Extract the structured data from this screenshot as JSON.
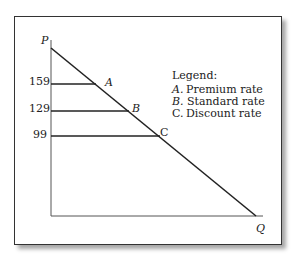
{
  "axes": {
    "y_label": "P",
    "x_label": "Q"
  },
  "price_ticks": [
    {
      "value": "159",
      "point": "A"
    },
    {
      "value": "129",
      "point": "B"
    },
    {
      "value": "99",
      "point": "C"
    }
  ],
  "legend": {
    "title": "Legend:",
    "items": [
      {
        "key": "A.",
        "label": "Premium rate"
      },
      {
        "key": "B.",
        "label": "Standard rate"
      },
      {
        "key": "C.",
        "label": "Discount rate"
      }
    ]
  },
  "colors": {
    "line": "#222222",
    "axis": "#555555"
  }
}
